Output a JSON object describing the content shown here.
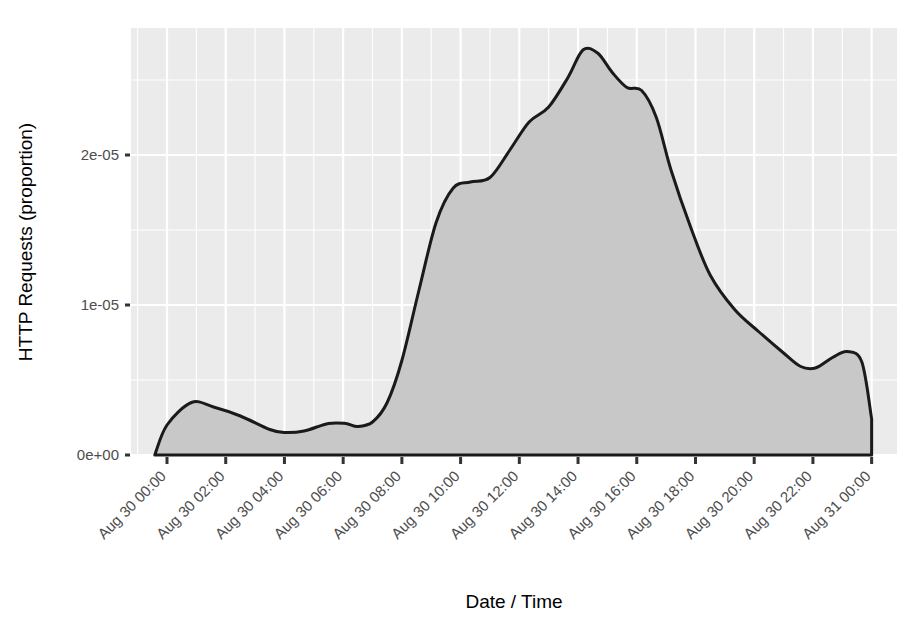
{
  "chart_data": {
    "type": "area",
    "title": "",
    "xlabel": "Date / Time",
    "ylabel": "HTTP Requests (proportion)",
    "x_tick_labels": [
      "Aug 30 00:00",
      "Aug 30 02:00",
      "Aug 30 04:00",
      "Aug 30 06:00",
      "Aug 30 08:00",
      "Aug 30 10:00",
      "Aug 30 12:00",
      "Aug 30 14:00",
      "Aug 30 16:00",
      "Aug 30 18:00",
      "Aug 30 20:00",
      "Aug 30 22:00",
      "Aug 31 00:00"
    ],
    "y_tick_labels": [
      "0e+00",
      "1e-05",
      "2e-05"
    ],
    "y_tick_values": [
      0,
      1e-05,
      2e-05
    ],
    "ylim": [
      0,
      2.85e-05
    ],
    "xlim": [
      "Aug 29 23:40",
      "Aug 31 00:05"
    ],
    "grid": true,
    "legend": "none",
    "line_color": "#1a1a1a",
    "fill_color": "#c8c8c8",
    "panel_background": "#ebebeb",
    "gridline_color": "#ffffff",
    "x": [
      "Aug 29 23:35",
      "Aug 30 00:00",
      "Aug 30 00:50",
      "Aug 30 01:35",
      "Aug 30 02:30",
      "Aug 30 03:30",
      "Aug 30 04:00",
      "Aug 30 04:40",
      "Aug 30 05:30",
      "Aug 30 06:05",
      "Aug 30 06:30",
      "Aug 30 07:00",
      "Aug 30 07:30",
      "Aug 30 08:00",
      "Aug 30 08:35",
      "Aug 30 09:10",
      "Aug 30 09:45",
      "Aug 30 10:20",
      "Aug 30 11:00",
      "Aug 30 11:40",
      "Aug 30 12:20",
      "Aug 30 13:00",
      "Aug 30 13:40",
      "Aug 30 14:10",
      "Aug 30 14:40",
      "Aug 30 15:10",
      "Aug 30 15:40",
      "Aug 30 16:10",
      "Aug 30 16:40",
      "Aug 30 17:10",
      "Aug 30 17:50",
      "Aug 30 18:30",
      "Aug 30 19:20",
      "Aug 30 20:10",
      "Aug 30 21:00",
      "Aug 30 21:35",
      "Aug 30 22:05",
      "Aug 30 22:40",
      "Aug 30 23:10",
      "Aug 30 23:40",
      "Aug 31 00:00"
    ],
    "y": [
      0.0,
      2e-06,
      3.5e-06,
      3.2e-06,
      2.6e-06,
      1.7e-06,
      1.5e-06,
      1.6e-06,
      2.1e-06,
      2.1e-06,
      1.9e-06,
      2.2e-06,
      3.5e-06,
      6.3e-06,
      1.1e-05,
      1.55e-05,
      1.78e-05,
      1.82e-05,
      1.85e-05,
      2.03e-05,
      2.22e-05,
      2.32e-05,
      2.52e-05,
      2.7e-05,
      2.68e-05,
      2.55e-05,
      2.45e-05,
      2.43e-05,
      2.25e-05,
      1.9e-05,
      1.52e-05,
      1.2e-05,
      9.7e-06,
      8.2e-06,
      6.8e-06,
      5.9e-06,
      5.8e-06,
      6.5e-06,
      6.9e-06,
      6.2e-06,
      2.4e-06
    ]
  }
}
